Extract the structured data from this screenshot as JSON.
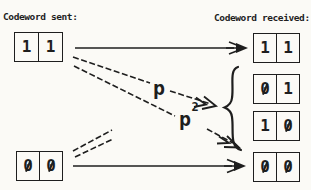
{
  "colors": {
    "ink": "#1e1e1e",
    "background": "#fbfaf6"
  },
  "headers": {
    "sent": "Codeword sent:",
    "received": "Codeword received:"
  },
  "sent_codewords": [
    {
      "id": "11",
      "bits": [
        "1",
        "1"
      ]
    },
    {
      "id": "00",
      "bits": [
        "0",
        "0"
      ]
    }
  ],
  "received_codewords": [
    {
      "id": "11",
      "bits": [
        "1",
        "1"
      ]
    },
    {
      "id": "01",
      "bits": [
        "0",
        "1"
      ]
    },
    {
      "id": "10",
      "bits": [
        "1",
        "0"
      ]
    },
    {
      "id": "00",
      "bits": [
        "0",
        "0"
      ]
    }
  ],
  "edge_labels": {
    "p": {
      "base": "p",
      "exponent": ""
    },
    "p_squared": {
      "base": "p",
      "exponent": "2"
    }
  },
  "connections": [
    {
      "from": "11",
      "to": "11",
      "label": ""
    },
    {
      "from": "11",
      "to": "01,10",
      "label": "p"
    },
    {
      "from": "11",
      "to": "00",
      "label": "p^2"
    },
    {
      "from": "00",
      "to": "01,10",
      "label": ""
    },
    {
      "from": "00",
      "to": "11",
      "label": ""
    },
    {
      "from": "00",
      "to": "00",
      "label": ""
    }
  ]
}
